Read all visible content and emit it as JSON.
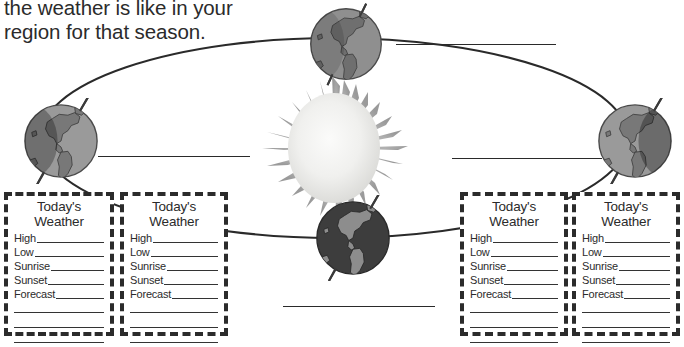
{
  "worksheet": {
    "instructions": {
      "line_cut": "believe weather forecasts and know what",
      "line_1": "the weather is like in your",
      "line_2": "region for that season."
    },
    "diagram": {
      "name": "earth-orbit-around-sun",
      "sun": {
        "name": "sun",
        "core_color": "#f2f2f0",
        "ray_color": "#a6a6a6"
      },
      "orbit": {
        "name": "orbit-ellipse",
        "color": "#2a2a2a"
      },
      "globes": [
        {
          "name": "globe-top",
          "position": "top",
          "tone": "#8c8c8c",
          "tilt_deg": -22
        },
        {
          "name": "globe-left",
          "position": "left",
          "tone": "#8c8c8c",
          "tilt_deg": -22
        },
        {
          "name": "globe-right",
          "position": "right",
          "tone": "#8c8c8c",
          "tilt_deg": -22
        },
        {
          "name": "globe-bottom",
          "position": "bottom",
          "tone": "#3a3a3a",
          "tilt_deg": -22
        }
      ],
      "answer_lines": [
        {
          "name": "answer-line-top",
          "position": "top"
        },
        {
          "name": "answer-line-left",
          "position": "left"
        },
        {
          "name": "answer-line-right",
          "position": "right"
        },
        {
          "name": "answer-line-bottom",
          "position": "bottom"
        }
      ]
    },
    "weather_card": {
      "title_line_1": "Today's",
      "title_line_2": "Weather",
      "fields": [
        "High",
        "Low",
        "Sunrise",
        "Sunset",
        "Forecast"
      ],
      "blank_lines": 3
    },
    "weather_cards": [
      {
        "name": "weather-card-1",
        "season_slot": "left-outer"
      },
      {
        "name": "weather-card-2",
        "season_slot": "left-inner"
      },
      {
        "name": "weather-card-3",
        "season_slot": "right-inner"
      },
      {
        "name": "weather-card-4",
        "season_slot": "right-outer"
      }
    ]
  }
}
